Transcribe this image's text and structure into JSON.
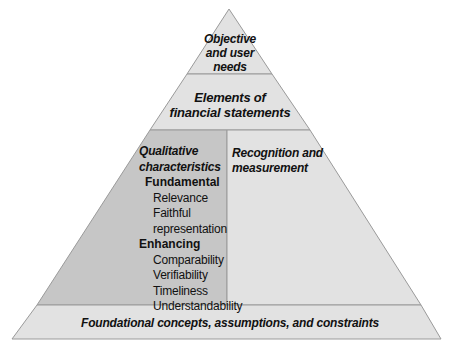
{
  "diagram": {
    "type": "pyramid",
    "levels": [
      {
        "id": "apex",
        "label": "Objective and user needs"
      },
      {
        "id": "second",
        "label": "Elements of financial statements"
      },
      {
        "id": "third_left",
        "title": "Qualitative characteristics",
        "groups": [
          {
            "label": "Fundamental",
            "items": [
              "Relevance",
              "Faithful representation"
            ]
          },
          {
            "label": "Enhancing",
            "items": [
              "Comparability",
              "Verifiability",
              "Timeliness",
              "Understandability"
            ]
          }
        ]
      },
      {
        "id": "third_right",
        "label": "Recognition and measurement"
      },
      {
        "id": "base",
        "label": "Foundational concepts, assumptions, and constraints"
      }
    ],
    "colors": {
      "light": "#e2e2e2",
      "dark": "#c6c6c6",
      "line": "#9a9a9a"
    }
  },
  "text": {
    "apex": [
      "Objective",
      "and user",
      "needs"
    ],
    "second": [
      "Elements of",
      "financial statements"
    ],
    "qual_title": [
      "Qualitative",
      "characteristics"
    ],
    "fundamental": "Fundamental",
    "relevance": "Relevance",
    "faithful": [
      "Faithful",
      "representation"
    ],
    "enhancing": "Enhancing",
    "comparability": "Comparability",
    "verifiability": "Verifiability",
    "timeliness": "Timeliness",
    "understandability": "Understandability",
    "recognition": [
      "Recognition and",
      "measurement"
    ],
    "base": "Foundational concepts, assumptions, and constraints"
  }
}
